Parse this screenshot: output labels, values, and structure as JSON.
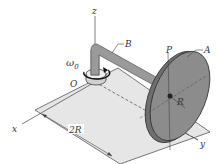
{
  "diagram": {
    "type": "rigid-body mechanism",
    "labels": {
      "z_axis": "z",
      "x_axis": "x",
      "y_axis": "y",
      "arm": "B",
      "disk": "A",
      "point": "P",
      "pivot": "O",
      "angular_velocity": "ω",
      "angular_velocity_sub": "0",
      "radius": "R",
      "distance": "2R"
    },
    "colors": {
      "plane": "#e6e6e6",
      "disk_face": "#8c8c8c",
      "disk_rim": "#6f6f6f",
      "arm": "#9a9a9a",
      "line": "#444444"
    }
  }
}
